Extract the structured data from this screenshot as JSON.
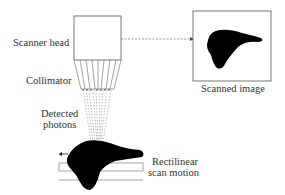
{
  "diagram": {
    "labels": {
      "scanner_head": "Scanner head",
      "collimator": "Collimator",
      "detected_photons_line1": "Detected",
      "detected_photons_line2": "photons",
      "rectilinear_line1": "Rectilinear",
      "rectilinear_line2": "scan motion",
      "scanned_image": "Scanned image"
    },
    "colors": {
      "stroke": "#555555",
      "fill_shape": "#000000",
      "text": "#333333"
    }
  }
}
